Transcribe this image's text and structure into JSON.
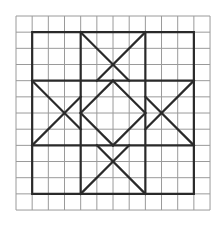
{
  "figure": {
    "type": "grid-pattern",
    "grid": {
      "columns": 12,
      "rows": 12,
      "origin_px": [
        16,
        16
      ],
      "cell_px": 16.17,
      "line_color": "#9a9a9a"
    },
    "pattern": {
      "line_color": "#2a2a2a",
      "outer_square": [
        [
          1,
          1
        ],
        [
          11,
          1
        ],
        [
          11,
          11
        ],
        [
          1,
          11
        ]
      ],
      "segments": [
        [
          [
            4,
            1
          ],
          [
            4,
            11
          ]
        ],
        [
          [
            8,
            1
          ],
          [
            8,
            11
          ]
        ],
        [
          [
            1,
            4
          ],
          [
            11,
            4
          ]
        ],
        [
          [
            1,
            8
          ],
          [
            11,
            8
          ]
        ],
        [
          [
            4,
            1
          ],
          [
            7,
            4
          ]
        ],
        [
          [
            8,
            1
          ],
          [
            5,
            4
          ]
        ],
        [
          [
            4,
            11
          ],
          [
            7,
            8
          ]
        ],
        [
          [
            8,
            11
          ],
          [
            5,
            8
          ]
        ],
        [
          [
            1,
            4
          ],
          [
            4,
            7
          ]
        ],
        [
          [
            1,
            8
          ],
          [
            4,
            5
          ]
        ],
        [
          [
            11,
            4
          ],
          [
            8,
            7
          ]
        ],
        [
          [
            11,
            8
          ],
          [
            8,
            5
          ]
        ],
        [
          [
            6,
            4
          ],
          [
            8,
            6
          ]
        ],
        [
          [
            8,
            6
          ],
          [
            6,
            8
          ]
        ],
        [
          [
            6,
            8
          ],
          [
            4,
            6
          ]
        ],
        [
          [
            4,
            6
          ],
          [
            6,
            4
          ]
        ]
      ]
    }
  }
}
